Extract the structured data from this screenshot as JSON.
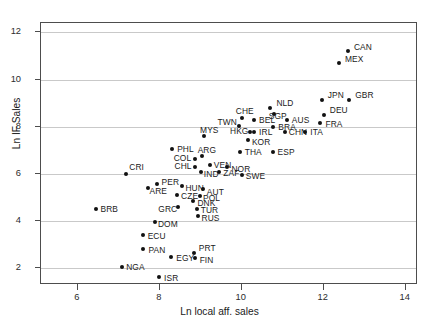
{
  "chart_data": {
    "type": "scatter",
    "title": "",
    "xlabel": "Ln local aff. sales",
    "ylabel": "Ln IF Sales",
    "xlim": [
      5.1,
      14.3
    ],
    "ylim": [
      1.3,
      12.4
    ],
    "xticks": [
      6,
      8,
      10,
      12,
      14
    ],
    "yticks": [
      2,
      4,
      6,
      8,
      10,
      12
    ],
    "grid": "horizontal",
    "legend": "none",
    "point_color": "#111111",
    "grid_color": "#c9c9c9",
    "axis_color": "#4d4d4d",
    "points": [
      {
        "label": "CAN",
        "x": 12.59,
        "y": 11.2,
        "lx": 6,
        "ly": -4
      },
      {
        "label": "MEX",
        "x": 12.37,
        "y": 10.7,
        "lx": 6,
        "ly": -4
      },
      {
        "label": "JPN",
        "x": 11.95,
        "y": 9.15,
        "lx": 6,
        "ly": -4
      },
      {
        "label": "GBR",
        "x": 12.62,
        "y": 9.15,
        "lx": 6,
        "ly": -4
      },
      {
        "label": "NLD",
        "x": 10.7,
        "y": 8.8,
        "lx": 6,
        "ly": -4
      },
      {
        "label": "DEU",
        "x": 12.0,
        "y": 8.52,
        "lx": 6,
        "ly": -4
      },
      {
        "label": "SGP",
        "x": 10.78,
        "y": 8.55,
        "lx": -5,
        "ly": 3
      },
      {
        "label": "CHE",
        "x": 10.0,
        "y": 8.38,
        "lx": -6,
        "ly": -6
      },
      {
        "label": "BEL",
        "x": 10.3,
        "y": 8.3,
        "lx": 5,
        "ly": 1
      },
      {
        "label": "AUS",
        "x": 11.1,
        "y": 8.3,
        "lx": 5,
        "ly": 1
      },
      {
        "label": "FRA",
        "x": 11.92,
        "y": 8.15,
        "lx": 5,
        "ly": 1
      },
      {
        "label": "TWN",
        "x": 9.92,
        "y": 8.02,
        "lx": -21,
        "ly": -4
      },
      {
        "label": "BRA",
        "x": 10.77,
        "y": 8.0,
        "lx": 5,
        "ly": 1
      },
      {
        "label": "MYS",
        "x": 9.08,
        "y": 7.6,
        "lx": -4,
        "ly": -6
      },
      {
        "label": "HKG",
        "x": 10.2,
        "y": 7.8,
        "lx": -20,
        "ly": 0
      },
      {
        "label": "IRL",
        "x": 10.3,
        "y": 7.8,
        "lx": 5,
        "ly": 1
      },
      {
        "label": "CHN",
        "x": 11.05,
        "y": 7.8,
        "lx": 4,
        "ly": 1
      },
      {
        "label": "ITA",
        "x": 11.55,
        "y": 7.8,
        "lx": 5,
        "ly": 1
      },
      {
        "label": "KOR",
        "x": 10.15,
        "y": 7.45,
        "lx": 4,
        "ly": 3
      },
      {
        "label": "PHL",
        "x": 8.3,
        "y": 7.08,
        "lx": 5,
        "ly": 1
      },
      {
        "label": "ARG",
        "x": 9.02,
        "y": 6.75,
        "lx": -4,
        "ly": -6
      },
      {
        "label": "THA",
        "x": 9.95,
        "y": 6.95,
        "lx": 5,
        "ly": 1
      },
      {
        "label": "ESP",
        "x": 10.75,
        "y": 6.95,
        "lx": 5,
        "ly": 1
      },
      {
        "label": "COL",
        "x": 8.85,
        "y": 6.65,
        "lx": -21,
        "ly": 0
      },
      {
        "label": "CHL",
        "x": 8.87,
        "y": 6.3,
        "lx": -21,
        "ly": 0
      },
      {
        "label": "VEN",
        "x": 9.22,
        "y": 6.4,
        "lx": 4,
        "ly": 1
      },
      {
        "label": "NOR",
        "x": 9.65,
        "y": 6.28,
        "lx": 4,
        "ly": 2
      },
      {
        "label": "IND",
        "x": 9.0,
        "y": 6.1,
        "lx": 3,
        "ly": 3
      },
      {
        "label": "ZAF",
        "x": 9.45,
        "y": 6.1,
        "lx": 4,
        "ly": 2
      },
      {
        "label": "SWE",
        "x": 10.0,
        "y": 5.95,
        "lx": 4,
        "ly": 1
      },
      {
        "label": "CRI",
        "x": 7.18,
        "y": 6.02,
        "lx": 3,
        "ly": -6
      },
      {
        "label": "PER",
        "x": 7.92,
        "y": 5.6,
        "lx": 5,
        "ly": -1
      },
      {
        "label": "ARE",
        "x": 7.7,
        "y": 5.4,
        "lx": 2,
        "ly": 3
      },
      {
        "label": "HUN",
        "x": 8.55,
        "y": 5.48,
        "lx": 3,
        "ly": 2
      },
      {
        "label": "AUT",
        "x": 9.05,
        "y": 5.35,
        "lx": 4,
        "ly": 3
      },
      {
        "label": "CZE",
        "x": 8.42,
        "y": 5.1,
        "lx": 4,
        "ly": 1
      },
      {
        "label": "POL",
        "x": 8.98,
        "y": 5.08,
        "lx": 3,
        "ly": 3
      },
      {
        "label": "DNK",
        "x": 8.82,
        "y": 4.85,
        "lx": 4,
        "ly": 2
      },
      {
        "label": "GRC",
        "x": 8.45,
        "y": 4.6,
        "lx": -20,
        "ly": 2
      },
      {
        "label": "TUR",
        "x": 8.9,
        "y": 4.52,
        "lx": 4,
        "ly": 2
      },
      {
        "label": "RUS",
        "x": 8.92,
        "y": 4.22,
        "lx": 4,
        "ly": 2
      },
      {
        "label": "BRB",
        "x": 6.43,
        "y": 4.52,
        "lx": 5,
        "ly": 1
      },
      {
        "label": "DOM",
        "x": 7.88,
        "y": 3.98,
        "lx": 3,
        "ly": 3
      },
      {
        "label": "ECU",
        "x": 7.58,
        "y": 3.4,
        "lx": 5,
        "ly": 1
      },
      {
        "label": "PAN",
        "x": 7.6,
        "y": 2.82,
        "lx": 5,
        "ly": 1
      },
      {
        "label": "EGY",
        "x": 8.28,
        "y": 2.48,
        "lx": 5,
        "ly": 1
      },
      {
        "label": "PRT",
        "x": 8.83,
        "y": 2.66,
        "lx": 5,
        "ly": -4
      },
      {
        "label": "FIN",
        "x": 8.85,
        "y": 2.45,
        "lx": 5,
        "ly": 3
      },
      {
        "label": "NGA",
        "x": 7.08,
        "y": 2.08,
        "lx": 4,
        "ly": 1
      },
      {
        "label": "ISR",
        "x": 7.98,
        "y": 1.62,
        "lx": 5,
        "ly": 1
      }
    ]
  }
}
